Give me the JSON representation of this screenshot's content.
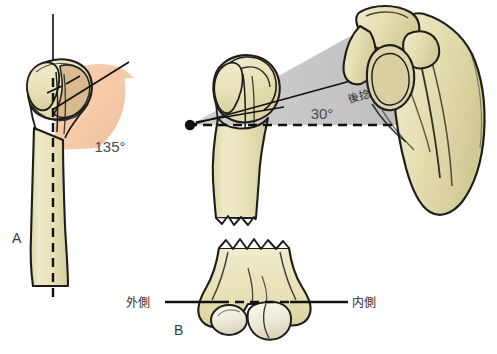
{
  "figure": {
    "panels": [
      {
        "id": "A",
        "letter": "A",
        "caption_label": "A",
        "view": "anterior proximal humerus with neck-shaft angle",
        "angle_label": "135°",
        "angle_value": 135,
        "angle_unit": "degrees"
      },
      {
        "id": "B",
        "letter": "B",
        "caption_label": "B",
        "view": "superior view humerus with retroversion angle and distal humerus epicondylar axis",
        "angle_label": "30°",
        "angle_value": 30,
        "angle_unit": "degrees",
        "retroversion_label": "後捻",
        "lateral_label": "外側",
        "medial_label": "内側"
      }
    ],
    "colors": {
      "bone_fill": "#e9e2b4",
      "bone_fill_light": "#f1ecd0",
      "bone_fill_shadow": "#d8d0a0",
      "cartilage_fill": "#e3ddb2",
      "outline": "#1d1d1b",
      "angle_wedge_peach": "#f6cba8",
      "angle_wedge_peach_dark": "#e8b890",
      "angle_wedge_gray": "#c2c2c2",
      "angle_wedge_gray_dark": "#b0b0b0",
      "axis_line": "#111111",
      "text": "#333333",
      "background": "#ffffff"
    }
  }
}
